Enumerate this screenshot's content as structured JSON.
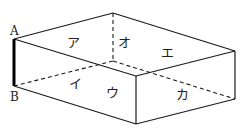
{
  "diagram": {
    "type": "cuboid",
    "vertices": {
      "A": [
        14,
        39
      ],
      "B": [
        14,
        86
      ],
      "top_back": [
        113,
        13
      ],
      "top_right": [
        235,
        51
      ],
      "top_front": [
        136,
        76
      ],
      "bottom_front": [
        136,
        124
      ],
      "bottom_right": [
        235,
        99
      ],
      "hidden_back": [
        113,
        61
      ]
    },
    "vertex_labels": [
      {
        "text": "A",
        "x": 10,
        "y": 35
      },
      {
        "text": "B",
        "x": 10,
        "y": 101
      }
    ],
    "face_labels": [
      {
        "text": "ア",
        "x": 73,
        "y": 47
      },
      {
        "text": "オ",
        "x": 121,
        "y": 47
      },
      {
        "text": "エ",
        "x": 164,
        "y": 57
      },
      {
        "text": "イ",
        "x": 71,
        "y": 88
      },
      {
        "text": "ウ",
        "x": 108,
        "y": 97
      },
      {
        "text": "カ",
        "x": 178,
        "y": 99
      }
    ],
    "highlighted_edge": "AB"
  }
}
